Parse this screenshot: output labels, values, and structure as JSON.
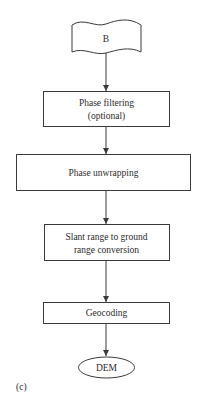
{
  "diagram": {
    "panel_label": "(c)",
    "nodes": [
      {
        "id": "B",
        "shape": "document",
        "lines": [
          "B"
        ]
      },
      {
        "id": "phase_filtering",
        "shape": "rect",
        "lines": [
          "Phase filtering",
          "(optional)"
        ]
      },
      {
        "id": "phase_unwrapping",
        "shape": "rect",
        "lines": [
          "Phase unwrapping"
        ]
      },
      {
        "id": "slant_to_ground",
        "shape": "rect",
        "lines": [
          "Slant range to ground",
          "range conversion"
        ]
      },
      {
        "id": "geocoding",
        "shape": "rect",
        "lines": [
          "Geocoding"
        ]
      },
      {
        "id": "dem",
        "shape": "ellipse",
        "lines": [
          "DEM"
        ]
      }
    ],
    "edges": [
      {
        "from": "B",
        "to": "phase_filtering"
      },
      {
        "from": "phase_filtering",
        "to": "phase_unwrapping"
      },
      {
        "from": "phase_unwrapping",
        "to": "slant_to_ground"
      },
      {
        "from": "slant_to_ground",
        "to": "geocoding"
      },
      {
        "from": "geocoding",
        "to": "dem"
      }
    ],
    "colors": {
      "stroke": "#3a3a3a",
      "text": "#2b2b2b",
      "background": "#ffffff"
    }
  }
}
